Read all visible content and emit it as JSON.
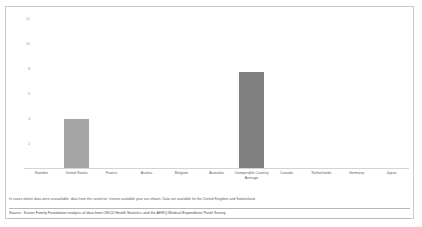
{
  "chart_data": {
    "type": "bar",
    "title": "",
    "subtitle": "",
    "xlabel": "",
    "ylabel": "",
    "ylim": [
      0,
      13
    ],
    "grid": false,
    "legend": null,
    "yticks": [
      "12",
      "10",
      "8",
      "6",
      "4",
      "2"
    ],
    "ytick_values": [
      12,
      10,
      8,
      6,
      4,
      2
    ],
    "categories": [
      "Sweden",
      "United States",
      "France",
      "Austria",
      "Belgium",
      "Australia",
      "Comparable Country Average",
      "Canada",
      "Netherlands",
      "Germany",
      "Japan"
    ],
    "values": [
      0,
      4.0,
      0,
      0,
      0,
      0,
      7.8,
      0,
      0,
      0,
      0
    ],
    "bar_colors": [
      "#a6a6a6",
      "#a6a6a6",
      "#a6a6a6",
      "#a6a6a6",
      "#a6a6a6",
      "#a6a6a6",
      "#808080",
      "#a6a6a6",
      "#a6a6a6",
      "#a6a6a6",
      "#a6a6a6"
    ]
  },
  "notes": {
    "footnote": "In cases where data were unavailable, data from the countries' closest available year are shown. Data not available for the United Kingdom and Switzerland.",
    "source": "Source : Kaiser Family Foundation analysis of data from OECD Health Statistics and the AHRQ Medical Expenditure Panel Survey"
  },
  "colors": {
    "bar_default": "#a6a6a6",
    "bar_highlight": "#808080",
    "axis": "#d4d4d4",
    "text": "#5a5a5a",
    "border": "#c9c9c9"
  }
}
